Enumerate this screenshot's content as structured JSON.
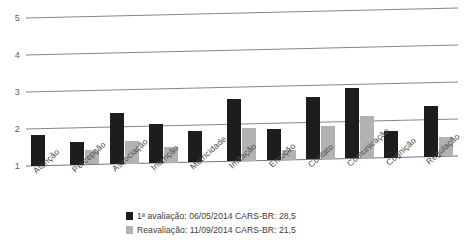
{
  "chart_data": {
    "type": "bar",
    "title": "",
    "xlabel": "",
    "ylabel": "",
    "ylim": [
      1,
      5
    ],
    "yticks": [
      1,
      2,
      3,
      4,
      5
    ],
    "ytick_labels": [
      "1",
      "2",
      "3",
      "4",
      "5"
    ],
    "grid": true,
    "legend_position": "bottom",
    "categories": [
      "Atenção",
      "Percepção",
      "Associação",
      "Intenção",
      "Motricidade",
      "Imitação",
      "Emoção",
      "Contato",
      "Comunicação",
      "Cognição",
      "Regulação"
    ],
    "series": [
      {
        "name": "1ª avaliação: 06/05/2014 CARS-BR: 28,5",
        "color": "#1d1d1d",
        "values": [
          1.82,
          1.62,
          2.38,
          2.05,
          1.85,
          2.68,
          1.85,
          2.68,
          2.9,
          1.72,
          2.37
        ]
      },
      {
        "name": "Reavaliação: 11/09/2014 CARS-BR: 21,5",
        "color": "#b2b2b2",
        "values": [
          null,
          1.38,
          1.62,
          1.43,
          null,
          1.88,
          1.28,
          1.9,
          2.13,
          null,
          1.52
        ]
      }
    ]
  },
  "legend": {
    "items": [
      {
        "label": "1ª avaliação: 06/05/2014 CARS-BR: 28,5",
        "color": "#1d1d1d"
      },
      {
        "label": "Reavaliação: 11/09/2014 CARS-BR: 21,5",
        "color": "#b2b2b2"
      }
    ]
  },
  "colors": {
    "primary": "#1d1d1d",
    "secondary": "#b2b2b2",
    "gridline": "#777777",
    "text": "#3d3d3d"
  }
}
